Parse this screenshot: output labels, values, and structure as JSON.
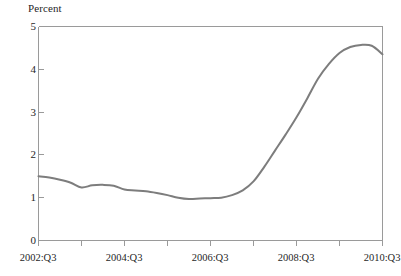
{
  "chart_data": {
    "type": "line",
    "title": "",
    "ylabel": "Percent",
    "xlabel": "",
    "ylim": [
      0,
      5
    ],
    "yticks": [
      0,
      1,
      2,
      3,
      4,
      5
    ],
    "ytick_labels": [
      "0",
      "1",
      "2",
      "3",
      "4",
      "5"
    ],
    "xtick_labels": [
      "2002:Q3",
      "2004:Q3",
      "2006:Q3",
      "2008:Q3",
      "2010:Q3"
    ],
    "xlim": [
      "2002:Q3",
      "2010:Q3"
    ],
    "grid": false,
    "legend": "none",
    "line_color": "#7d7d7d",
    "frame_color": "#9a9a9a",
    "x": [
      "2002:Q3",
      "2002:Q4",
      "2003:Q1",
      "2003:Q2",
      "2003:Q3",
      "2003:Q4",
      "2004:Q1",
      "2004:Q2",
      "2004:Q3",
      "2004:Q4",
      "2005:Q1",
      "2005:Q2",
      "2005:Q3",
      "2005:Q4",
      "2006:Q1",
      "2006:Q2",
      "2006:Q3",
      "2006:Q4",
      "2007:Q1",
      "2007:Q2",
      "2007:Q3",
      "2007:Q4",
      "2008:Q1",
      "2008:Q2",
      "2008:Q3",
      "2008:Q4",
      "2009:Q1",
      "2009:Q2",
      "2009:Q3",
      "2009:Q4",
      "2010:Q1",
      "2010:Q2",
      "2010:Q3"
    ],
    "values": [
      1.5,
      1.47,
      1.42,
      1.35,
      1.24,
      1.29,
      1.3,
      1.28,
      1.19,
      1.17,
      1.15,
      1.11,
      1.06,
      1.0,
      0.97,
      0.98,
      0.99,
      1.0,
      1.06,
      1.17,
      1.38,
      1.72,
      2.1,
      2.48,
      2.88,
      3.32,
      3.78,
      4.12,
      4.38,
      4.52,
      4.57,
      4.55,
      4.35
    ],
    "annotations": []
  },
  "axis": {
    "y_title": "Percent"
  }
}
